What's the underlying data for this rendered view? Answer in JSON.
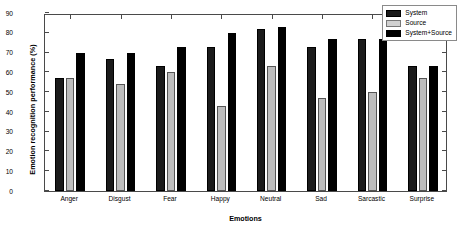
{
  "chart_data": {
    "type": "bar",
    "title": "",
    "xlabel": "Emotions",
    "ylabel": "Emotion recognition performance (%)",
    "categories": [
      "Anger",
      "Disgust",
      "Fear",
      "Happy",
      "Neutral",
      "Sad",
      "Sarcastic",
      "Surprise"
    ],
    "series": [
      {
        "name": "System",
        "color": "#1b1b1b",
        "values": [
          57,
          67,
          63,
          73,
          82,
          73,
          77,
          63
        ]
      },
      {
        "name": "Source",
        "color": "#bdbdbd",
        "values": [
          57,
          54,
          60,
          43,
          63,
          47,
          50,
          57
        ]
      },
      {
        "name": "System+Source",
        "color": "#000000",
        "values": [
          70,
          70,
          73,
          80,
          83,
          77,
          77,
          63
        ]
      }
    ],
    "ylim": [
      0,
      90
    ],
    "yticks": [
      0,
      10,
      20,
      30,
      40,
      50,
      60,
      70,
      80,
      90
    ],
    "ytick_labels": [
      "0",
      "10",
      "20",
      "30",
      "40",
      "50",
      "60",
      "70",
      "80",
      "90"
    ],
    "grid": false,
    "legend_position": "top-right"
  },
  "legend": {
    "items": [
      {
        "label": "System"
      },
      {
        "label": "Source"
      },
      {
        "label": "System+Source"
      }
    ]
  }
}
